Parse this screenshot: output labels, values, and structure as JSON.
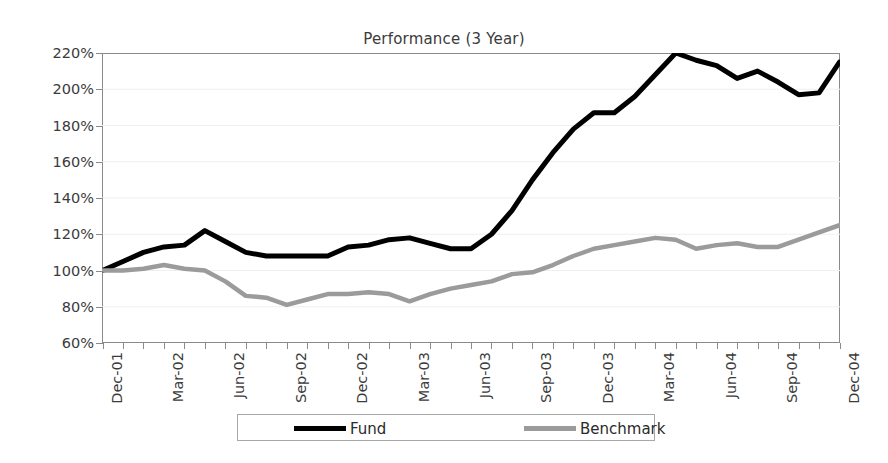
{
  "chart_data": {
    "type": "line",
    "title": "Performance (3 Year)",
    "xlabel": "",
    "ylabel": "",
    "ylim": [
      60,
      220
    ],
    "ytick_values": [
      220,
      200,
      180,
      160,
      140,
      120,
      100,
      80,
      60
    ],
    "ytick_labels": [
      "220%",
      "200%",
      "180%",
      "160%",
      "140%",
      "120%",
      "100%",
      "80%",
      "60%"
    ],
    "grid": true,
    "legend_position": "bottom",
    "x": [
      "Dec-01",
      "Jan-02",
      "Feb-02",
      "Mar-02",
      "Apr-02",
      "May-02",
      "Jun-02",
      "Jul-02",
      "Aug-02",
      "Sep-02",
      "Oct-02",
      "Nov-02",
      "Dec-02",
      "Jan-03",
      "Feb-03",
      "Mar-03",
      "Apr-03",
      "May-03",
      "Jun-03",
      "Jul-03",
      "Aug-03",
      "Sep-03",
      "Oct-03",
      "Nov-03",
      "Dec-03",
      "Jan-04",
      "Feb-04",
      "Mar-04",
      "Apr-04",
      "May-04",
      "Jun-04",
      "Jul-04",
      "Aug-04",
      "Sep-04",
      "Oct-04",
      "Nov-04",
      "Dec-04"
    ],
    "xtick_labels": [
      "Dec-01",
      "Mar-02",
      "Jun-02",
      "Sep-02",
      "Dec-02",
      "Mar-03",
      "Jun-03",
      "Sep-03",
      "Dec-03",
      "Mar-04",
      "Jun-04",
      "Sep-04",
      "Dec-04"
    ],
    "xtick_indices": [
      0,
      3,
      6,
      9,
      12,
      15,
      18,
      21,
      24,
      27,
      30,
      33,
      36
    ],
    "series": [
      {
        "name": "Fund",
        "color": "#000000",
        "values": [
          100,
          105,
          110,
          113,
          114,
          122,
          116,
          110,
          108,
          108,
          108,
          108,
          113,
          114,
          117,
          118,
          115,
          112,
          112,
          120,
          133,
          150,
          165,
          178,
          187,
          187,
          196,
          208,
          220,
          216,
          213,
          206,
          210,
          204,
          197,
          198,
          215
        ]
      },
      {
        "name": "Benchmark",
        "color": "#9b9b9b",
        "values": [
          100,
          100,
          101,
          103,
          101,
          100,
          94,
          86,
          85,
          81,
          84,
          87,
          87,
          88,
          87,
          83,
          87,
          90,
          92,
          94,
          98,
          99,
          103,
          108,
          112,
          114,
          116,
          118,
          117,
          112,
          114,
          115,
          113,
          113,
          117,
          121,
          125
        ]
      }
    ]
  },
  "legend": {
    "entries": [
      {
        "label": "Fund"
      },
      {
        "label": "Benchmark"
      }
    ]
  }
}
